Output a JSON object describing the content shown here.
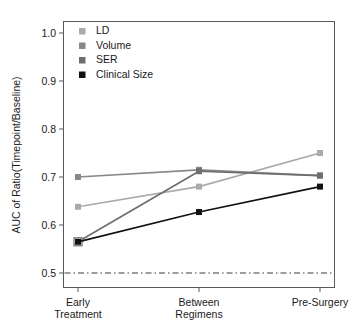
{
  "chart_data": {
    "type": "line",
    "title": "",
    "subtitle": "",
    "xlabel": "",
    "ylabel": "AUC of Ratio(Timepoint/Baseline)",
    "categories": [
      "Early\nTreatment",
      "Between\nRegimens",
      "Pre-Surgery"
    ],
    "category_labels": [
      {
        "line1": "Early",
        "line2": "Treatment"
      },
      {
        "line1": "Between",
        "line2": "Regimens"
      },
      {
        "line1": "Pre-Surgery",
        "line2": ""
      }
    ],
    "ylim": [
      0.48,
      1.02
    ],
    "yticks": [
      0.5,
      0.6,
      0.7,
      0.8,
      0.9,
      1.0
    ],
    "ytick_labels": [
      "0.5",
      "0.6",
      "0.7",
      "0.8",
      "0.9",
      "1.0"
    ],
    "grid": false,
    "legend_position": "top-left",
    "reference_line": {
      "value": 0.5,
      "style": "dashdot",
      "color": "#3a3a3a"
    },
    "series": [
      {
        "name": "LD",
        "color": "#aaaaaa",
        "marker": "filled-square",
        "values": [
          0.638,
          0.68,
          0.75
        ]
      },
      {
        "name": "Volume",
        "color": "#888888",
        "marker": "filled-square",
        "values": [
          0.7,
          0.715,
          0.703
        ]
      },
      {
        "name": "SER",
        "color": "#6e6e6e",
        "marker": "open-square-first",
        "values": [
          0.565,
          0.712,
          0.703
        ]
      },
      {
        "name": "Clinical Size",
        "color": "#111111",
        "marker": "filled-square",
        "values": [
          0.565,
          0.627,
          0.68
        ]
      }
    ]
  },
  "legend": {
    "items": [
      {
        "label": "LD",
        "color": "#aaaaaa"
      },
      {
        "label": "Volume",
        "color": "#888888"
      },
      {
        "label": "SER",
        "color": "#6e6e6e"
      },
      {
        "label": "Clinical Size",
        "color": "#111111"
      }
    ]
  }
}
